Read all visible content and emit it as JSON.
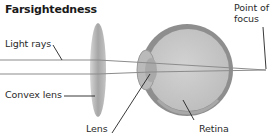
{
  "title": "Farsightedness",
  "labels": {
    "light_rays": "Light rays",
    "convex_lens": "Convex lens",
    "lens": "Lens",
    "retina": "Retina",
    "point_of_focus_line1": "Point of",
    "point_of_focus_line2": "focus"
  },
  "colors": {
    "ray": "#8c8c8c",
    "convex_lens": "#a8a8a8",
    "eye_outer": "#8f8f8f",
    "eye_inner": "#c9c9c9",
    "text": "#1a1a1a",
    "leader": "#222222"
  }
}
